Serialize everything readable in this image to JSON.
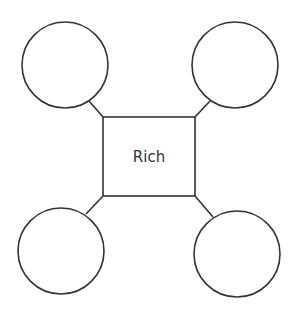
{
  "diagram": {
    "center_box": {
      "label": "Rich",
      "x": 103,
      "y": 117,
      "width": 92,
      "height": 79
    },
    "circles": [
      {
        "position": "top-left",
        "label": "",
        "cx": 65,
        "cy": 65,
        "r": 43
      },
      {
        "position": "top-right",
        "label": "",
        "cx": 235,
        "cy": 65,
        "r": 43
      },
      {
        "position": "bottom-left",
        "label": "",
        "cx": 61,
        "cy": 251,
        "r": 43
      },
      {
        "position": "bottom-right",
        "label": "",
        "cx": 237,
        "cy": 254,
        "r": 43
      }
    ],
    "stroke_color": "#333333",
    "background_color": "#ffffff"
  }
}
